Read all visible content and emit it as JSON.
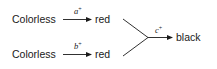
{
  "diagram": {
    "type": "pathway",
    "nodes": {
      "start_top": "Colorless",
      "mid_top": "red",
      "start_bottom": "Colorless",
      "mid_bottom": "red",
      "end": "black"
    },
    "edges": [
      {
        "from": "Colorless",
        "to": "red",
        "label": "a",
        "label_sup": "+"
      },
      {
        "from": "Colorless",
        "to": "red",
        "label": "b",
        "label_sup": "+"
      },
      {
        "from": "red + red",
        "to": "black",
        "label": "c",
        "label_sup": "+"
      }
    ],
    "colors": {
      "ink": "#1a1a1a",
      "background": "#ffffff"
    }
  }
}
